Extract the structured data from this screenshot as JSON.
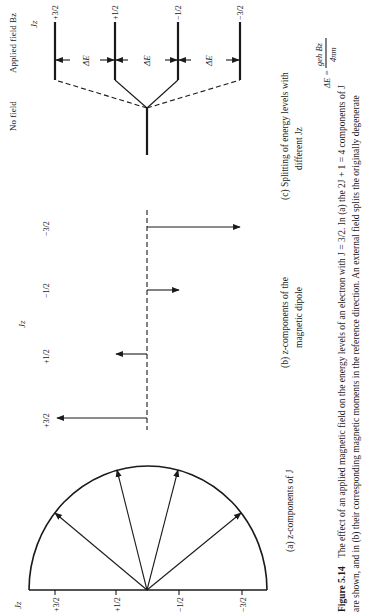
{
  "figure": {
    "number": "Figure 5.14",
    "orientation": "rotated 90° counter-clockwise (text reads bottom to top)",
    "caption_line1_bold": "Figure 5.14",
    "caption_line1": "The effect of an applied magnetic field on the energy levels of an electron with J = 3/2. In (a) the 2J + 1 = 4 components of J",
    "caption_line2": "are shown, and in (b) their corresponding magnetic moments in the reference direction. An external field splits the originally degenerate"
  },
  "panel_a": {
    "label": "(a)  z-components of J",
    "axis_label": "Jz",
    "ticks": [
      "+3/2",
      "+1/2",
      "−1/2",
      "−3/2"
    ]
  },
  "panel_b": {
    "label_line1": "(b)  z-components of the",
    "label_line2": "magnetic dipole",
    "axis_label": "Jz",
    "ticks": [
      "+3/2",
      "+1/2",
      "−1/2",
      "−3/2"
    ]
  },
  "panel_c": {
    "label_line1": "(c)  Splitting of energy levels with",
    "label_line2": "different Jz",
    "no_field_label": "No field",
    "applied_field_label": "Applied field Bz",
    "axis_label": "Jz",
    "levels": [
      "+3/2",
      "+1/2",
      "−1/2",
      "−3/2"
    ],
    "delta_label": "ΔE",
    "formula_lhs": "ΔE =",
    "formula_num": "geh Bz",
    "formula_den": "4πm"
  }
}
